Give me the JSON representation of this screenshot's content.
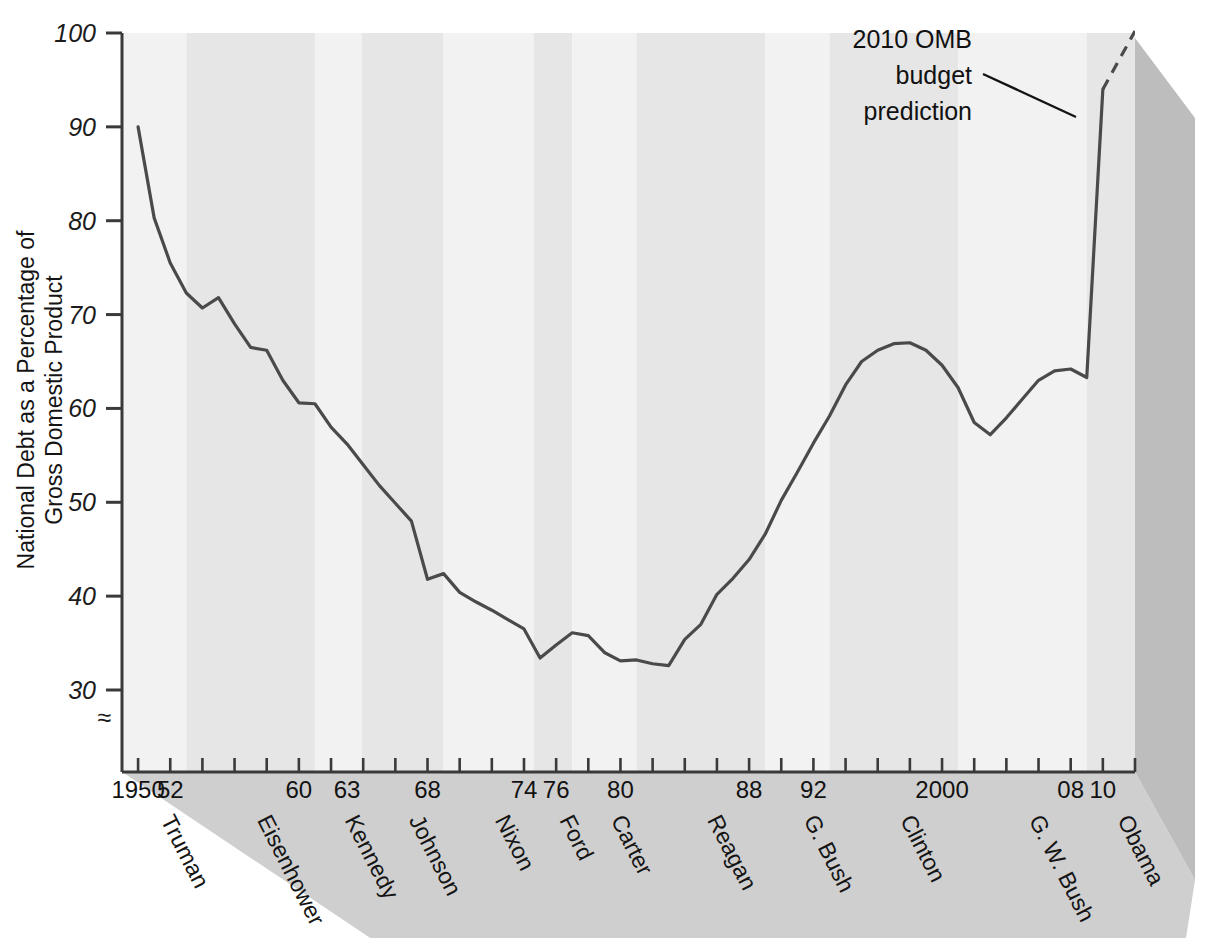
{
  "chart_data": {
    "type": "line",
    "title": "",
    "ylabel_line1": "National Debt as a Percentage of",
    "ylabel_line2": "Gross Domestic Product",
    "xlabel": "",
    "ylim": [
      26,
      100
    ],
    "xlim": [
      1949,
      2012
    ],
    "y_ticks": [
      30,
      40,
      50,
      60,
      70,
      80,
      90,
      100
    ],
    "y_tick_labels": [
      "30",
      "40",
      "50",
      "60",
      "70",
      "80",
      "90",
      "100"
    ],
    "axis_break_symbol": "≈",
    "x_tick_years": [
      1950,
      1952,
      1954,
      1956,
      1958,
      1960,
      1962,
      1964,
      1966,
      1968,
      1970,
      1972,
      1974,
      1976,
      1978,
      1980,
      1982,
      1984,
      1986,
      1988,
      1990,
      1992,
      1994,
      1996,
      1998,
      2000,
      2002,
      2004,
      2006,
      2008,
      2010,
      2012
    ],
    "x_tick_labels": [
      {
        "year": 1950,
        "label": "1950"
      },
      {
        "year": 1952,
        "label": "52"
      },
      {
        "year": 1960,
        "label": "60"
      },
      {
        "year": 1963,
        "label": "63"
      },
      {
        "year": 1968,
        "label": "68"
      },
      {
        "year": 1974,
        "label": "74"
      },
      {
        "year": 1976,
        "label": "76"
      },
      {
        "year": 1980,
        "label": "80"
      },
      {
        "year": 1988,
        "label": "88"
      },
      {
        "year": 1992,
        "label": "92"
      },
      {
        "year": 2000,
        "label": "2000"
      },
      {
        "year": 2008,
        "label": "08"
      },
      {
        "year": 2010,
        "label": "10"
      }
    ],
    "grid": false,
    "legend": "none",
    "annotations": [
      {
        "name": "omb-prediction",
        "text_lines": [
          "2010 OMB",
          "budget",
          "prediction"
        ],
        "points_to_year": 2010
      }
    ],
    "presidents": [
      {
        "name": "Truman",
        "start": 1949,
        "end": 1953,
        "shade": "light"
      },
      {
        "name": "Eisenhower",
        "start": 1953,
        "end": 1961,
        "shade": "dark"
      },
      {
        "name": "Kennedy",
        "start": 1961,
        "end": 1963.9,
        "shade": "light"
      },
      {
        "name": "Johnson",
        "start": 1963.9,
        "end": 1969,
        "shade": "dark"
      },
      {
        "name": "Nixon",
        "start": 1969,
        "end": 1974.6,
        "shade": "light"
      },
      {
        "name": "Ford",
        "start": 1974.6,
        "end": 1977,
        "shade": "dark"
      },
      {
        "name": "Carter",
        "start": 1977,
        "end": 1981,
        "shade": "light"
      },
      {
        "name": "Reagan",
        "start": 1981,
        "end": 1989,
        "shade": "dark"
      },
      {
        "name": "G. Bush",
        "start": 1989,
        "end": 1993,
        "shade": "light"
      },
      {
        "name": "Clinton",
        "start": 1993,
        "end": 2001,
        "shade": "dark"
      },
      {
        "name": "G. W. Bush",
        "start": 2001,
        "end": 2009,
        "shade": "light"
      },
      {
        "name": "Obama",
        "start": 2009,
        "end": 2012,
        "shade": "dark"
      }
    ],
    "series": [
      {
        "name": "National debt as % of GDP (actual)",
        "style": "solid",
        "x": [
          1950,
          1951,
          1952,
          1953,
          1954,
          1955,
          1956,
          1957,
          1958,
          1959,
          1960,
          1961,
          1962,
          1963,
          1964,
          1965,
          1966,
          1967,
          1968,
          1969,
          1970,
          1971,
          1972,
          1973,
          1974,
          1975,
          1976,
          1977,
          1978,
          1979,
          1980,
          1981,
          1982,
          1983,
          1984,
          1985,
          1986,
          1987,
          1988,
          1989,
          1990,
          1991,
          1992,
          1993,
          1994,
          1995,
          1996,
          1997,
          1998,
          1999,
          2000,
          2001,
          2002,
          2003,
          2004,
          2005,
          2006,
          2007,
          2008,
          2009,
          2010
        ],
        "y": [
          90.0,
          80.3,
          75.5,
          72.3,
          70.7,
          71.8,
          69.0,
          66.5,
          66.2,
          63.0,
          60.6,
          60.5,
          58.0,
          56.2,
          54.0,
          51.8,
          49.9,
          48.0,
          41.8,
          42.4,
          40.4,
          39.4,
          38.5,
          37.5,
          36.5,
          33.4,
          34.8,
          36.1,
          35.8,
          34.0,
          33.1,
          33.2,
          32.8,
          32.6,
          35.4,
          37.0,
          40.2,
          41.9,
          43.9,
          46.6,
          50.2,
          53.2,
          56.3,
          59.2,
          62.5,
          65.0,
          66.2,
          66.9,
          67.0,
          66.2,
          64.6,
          62.2,
          58.5,
          57.2,
          59.0,
          61.0,
          63.0,
          64.0,
          64.2,
          63.3,
          94.0
        ],
        "color": "#4a4a4a",
        "width": 3.2
      },
      {
        "name": "2010 OMB budget prediction",
        "style": "dashed",
        "x": [
          2010,
          2012
        ],
        "y": [
          94.0,
          100.5
        ],
        "color": "#4a4a4a",
        "width": 3.2
      }
    ]
  },
  "colors": {
    "panel_light": "#f2f2f2",
    "panel_dark": "#e6e6e6",
    "floor": "#cfcfcf",
    "right_face": "#bdbdbd",
    "axis": "#3a3a3a",
    "line": "#4a4a4a",
    "text": "#141414",
    "background": "#ffffff"
  },
  "figure": {
    "width": 1226,
    "height": 946
  }
}
